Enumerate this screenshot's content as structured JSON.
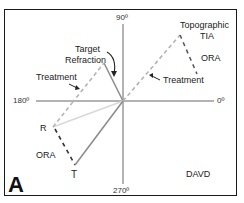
{
  "diagram": {
    "panel_letter": "A",
    "method_label": "DAVD",
    "axes": {
      "top": "90º",
      "bottom": "270º",
      "left": "180º",
      "right": "0º"
    },
    "labels": {
      "target_refraction": [
        "Target",
        "Refraction"
      ],
      "treatment_left": "Treatment",
      "topographic_tia": [
        "Topographic",
        "TIA"
      ],
      "ora_upper": "ORA",
      "treatment_right": "Treatment",
      "r_point": "R",
      "ora_lower": "ORA",
      "t_point": "T"
    },
    "colors": {
      "axis": "#9a9a9a",
      "solid_vector": "#8c8c8c",
      "dashed_vector": "#b4b4b4",
      "ora_dashed": "#333333",
      "faint_vector": "#d8d8d8",
      "frame": "#1a1a1a"
    }
  }
}
